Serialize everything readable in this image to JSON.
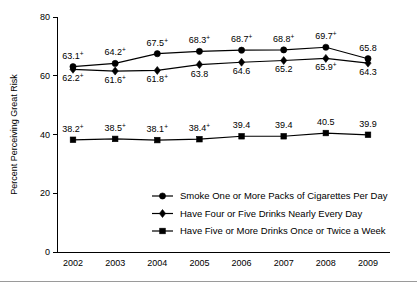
{
  "chart_data": {
    "type": "line",
    "title": "",
    "xlabel": "",
    "ylabel": "Percent Perceiving Great Risk",
    "categories": [
      "2002",
      "2003",
      "2004",
      "2005",
      "2006",
      "2007",
      "2008",
      "2009"
    ],
    "ylim": [
      0,
      80
    ],
    "yticks": [
      "0",
      "20",
      "40",
      "60",
      "80"
    ],
    "grid": false,
    "legend_position": "inside-lower-center",
    "series": [
      {
        "name": "Smoke One or More Packs of Cigarettes Per Day",
        "marker": "circle",
        "values": [
          63.1,
          64.2,
          67.5,
          68.3,
          68.7,
          68.8,
          69.7,
          65.8
        ],
        "labels": [
          "63.1",
          "64.2",
          "67.5",
          "68.3",
          "68.7",
          "68.8",
          "69.7",
          "65.8"
        ],
        "significance": [
          "+",
          "+",
          "+",
          "+",
          "+",
          "+",
          "+",
          ""
        ],
        "label_side": [
          "above",
          "above",
          "above",
          "above",
          "above",
          "above",
          "above",
          "above"
        ]
      },
      {
        "name": "Have Four or Five Drinks Nearly Every Day",
        "marker": "diamond",
        "values": [
          62.2,
          61.6,
          61.8,
          63.8,
          64.6,
          65.2,
          65.9,
          64.3
        ],
        "labels": [
          "62.2",
          "61.6",
          "61.8",
          "63.8",
          "64.6",
          "65.2",
          "65.9",
          "64.3"
        ],
        "significance": [
          "+",
          "+",
          "+",
          "",
          "",
          "",
          "+",
          ""
        ],
        "label_side": [
          "below",
          "below",
          "below",
          "below",
          "below",
          "below",
          "below",
          "below"
        ]
      },
      {
        "name": "Have Five or More Drinks Once or Twice a Week",
        "marker": "square",
        "values": [
          38.2,
          38.5,
          38.1,
          38.4,
          39.4,
          39.4,
          40.5,
          39.9
        ],
        "labels": [
          "38.2",
          "38.5",
          "38.1",
          "38.4",
          "39.4",
          "39.4",
          "40.5",
          "39.9"
        ],
        "significance": [
          "+",
          "+",
          "+",
          "+",
          "",
          "",
          "",
          ""
        ],
        "label_side": [
          "above",
          "above",
          "above",
          "above",
          "above",
          "above",
          "above",
          "above"
        ]
      }
    ]
  },
  "legend": {
    "items": [
      {
        "label": "Smoke One or More Packs of Cigarettes Per Day",
        "marker": "circle"
      },
      {
        "label": "Have Four or Five Drinks Nearly Every Day",
        "marker": "diamond"
      },
      {
        "label": "Have Five or More Drinks Once or Twice a Week",
        "marker": "square"
      }
    ]
  },
  "colors": {
    "ink": "#000000",
    "rule": "#9a9a9a",
    "background": "#ffffff"
  }
}
